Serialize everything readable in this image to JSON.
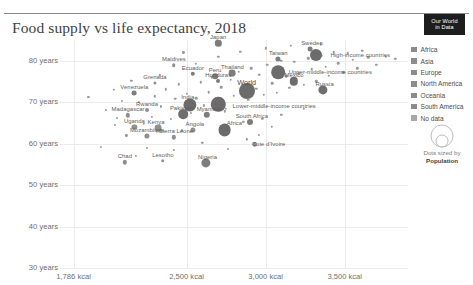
{
  "header": {
    "title": "Food supply vs life expectancy, 2018",
    "logo_line1": "Our World",
    "logo_line2": "in Data"
  },
  "legend": {
    "items": [
      {
        "label": "Africa",
        "color": "#8c8c8c"
      },
      {
        "label": "Asia",
        "color": "#8c8c8c"
      },
      {
        "label": "Europe",
        "color": "#8c8c8c"
      },
      {
        "label": "North America",
        "color": "#8c8c8c"
      },
      {
        "label": "Oceania",
        "color": "#8c8c8c"
      },
      {
        "label": "South America",
        "color": "#8c8c8c"
      },
      {
        "label": "No data",
        "color": "#a8a8a8"
      }
    ],
    "size_caption_line1": "Dots sized by",
    "size_caption_line2": "Population",
    "size_bubble_labels": [
      "1B",
      "2B"
    ]
  },
  "chart_data": {
    "type": "scatter",
    "title": "Food supply vs life expectancy, 2018",
    "xlabel": "",
    "ylabel": "Life expectancy at birth",
    "xticks": [
      "1,786 kcal",
      "2,500 kcal",
      "3,000 kcal",
      "3,500 kcal"
    ],
    "xtick_values": [
      1786,
      2500,
      3000,
      3500
    ],
    "yticks": [
      "30 years",
      "40 years",
      "50 years",
      "60 years",
      "70 years",
      "80 years"
    ],
    "ytick_values": [
      30,
      40,
      50,
      60,
      70,
      80
    ],
    "xlim": [
      1700,
      3900
    ],
    "ylim": [
      30,
      85
    ],
    "grid": true,
    "legend_position": "right",
    "points": [
      {
        "name": "Japan",
        "x": 2700,
        "y": 84.2,
        "r": 3.2,
        "color": "#7d7d7d",
        "label": true,
        "lx": 0,
        "ly": -6
      },
      {
        "name": "Taiwan",
        "x": 3080,
        "y": 80.5,
        "r": 2.6,
        "color": "#7d7d7d",
        "label": true,
        "lx": 0,
        "ly": -6
      },
      {
        "name": "Sweden",
        "x": 3280,
        "y": 82.8,
        "r": 2.4,
        "color": "#7d7d7d",
        "label": true,
        "lx": 2,
        "ly": -6
      },
      {
        "name": "Maldives",
        "x": 2420,
        "y": 78.9,
        "r": 1.8,
        "color": "#8f8f8f",
        "label": true,
        "lx": 0,
        "ly": -6
      },
      {
        "name": "Thailand",
        "x": 2790,
        "y": 77.0,
        "r": 3.4,
        "color": "#7d7d7d",
        "label": true,
        "lx": 0,
        "ly": -6
      },
      {
        "name": "Ecuador",
        "x": 2540,
        "y": 76.8,
        "r": 2.2,
        "color": "#7d7d7d",
        "label": true,
        "lx": 0,
        "ly": -6
      },
      {
        "name": "Peru",
        "x": 2680,
        "y": 76.3,
        "r": 2.8,
        "color": "#7d7d7d",
        "label": true,
        "lx": 0,
        "ly": -6
      },
      {
        "name": "Grenada",
        "x": 2300,
        "y": 74.6,
        "r": 1.6,
        "color": "#8f8f8f",
        "label": true,
        "lx": 0,
        "ly": -6
      },
      {
        "name": "Venezuela",
        "x": 2170,
        "y": 72.2,
        "r": 2.4,
        "color": "#7d7d7d",
        "label": true,
        "lx": 0,
        "ly": -6
      },
      {
        "name": "Mexico",
        "x": 3180,
        "y": 75.0,
        "r": 4.2,
        "color": "#6e6e6e",
        "label": true,
        "lx": 0,
        "ly": -6
      },
      {
        "name": "Russia",
        "x": 3360,
        "y": 72.9,
        "r": 4.6,
        "color": "#6e6e6e",
        "label": true,
        "lx": 2,
        "ly": -6
      },
      {
        "name": "World",
        "x": 2880,
        "y": 72.6,
        "r": 8.0,
        "color": "#6b6b6b",
        "label": true,
        "lx": 0,
        "ly": -9,
        "big": true
      },
      {
        "name": "India",
        "x": 2520,
        "y": 69.4,
        "r": 6.6,
        "color": "#6b6b6b",
        "label": true,
        "lx": -2,
        "ly": -8
      },
      {
        "name": "Honduras",
        "x": 2700,
        "y": 75.1,
        "r": 2.0,
        "color": "#7d7d7d",
        "label": true,
        "lx": 0,
        "ly": -6
      },
      {
        "name": "Pakistan",
        "x": 2480,
        "y": 67.1,
        "r": 4.8,
        "color": "#6e6e6e",
        "label": true,
        "lx": -2,
        "ly": -6
      },
      {
        "name": "Myanmar",
        "x": 2630,
        "y": 66.9,
        "r": 3.2,
        "color": "#7d7d7d",
        "label": true,
        "lx": 2,
        "ly": -6
      },
      {
        "name": "South Africa",
        "x": 2900,
        "y": 65.3,
        "r": 3.0,
        "color": "#7d7d7d",
        "label": true,
        "lx": 2,
        "ly": -6
      },
      {
        "name": "Rwanda",
        "x": 2250,
        "y": 68.0,
        "r": 2.0,
        "color": "#8f8f8f",
        "label": true,
        "lx": 0,
        "ly": -6
      },
      {
        "name": "Madagascar",
        "x": 2130,
        "y": 66.8,
        "r": 2.2,
        "color": "#8f8f8f",
        "label": true,
        "lx": 0,
        "ly": -6
      },
      {
        "name": "Uganda",
        "x": 2170,
        "y": 64.0,
        "r": 2.6,
        "color": "#8f8f8f",
        "label": true,
        "lx": 0,
        "ly": -6
      },
      {
        "name": "Kenya",
        "x": 2320,
        "y": 63.8,
        "r": 3.4,
        "color": "#8f8f8f",
        "label": true,
        "lx": -2,
        "ly": -6
      },
      {
        "name": "Angola",
        "x": 2540,
        "y": 63.4,
        "r": 2.6,
        "color": "#8f8f8f",
        "label": true,
        "lx": 2,
        "ly": -6
      },
      {
        "name": "Mozambique",
        "x": 2250,
        "y": 61.8,
        "r": 2.6,
        "color": "#8f8f8f",
        "label": true,
        "lx": 0,
        "ly": -6
      },
      {
        "name": "Sierra Leone",
        "x": 2420,
        "y": 61.5,
        "r": 2.2,
        "color": "#8f8f8f",
        "label": true,
        "lx": 2,
        "ly": -6
      },
      {
        "name": "Africa",
        "x": 2740,
        "y": 63.2,
        "r": 6.4,
        "color": "#6b6b6b",
        "label": true,
        "lx": 10,
        "ly": -7
      },
      {
        "name": "Cote d'Ivoire",
        "x": 2930,
        "y": 59.8,
        "r": 2.2,
        "color": "#8f8f8f",
        "label": true,
        "lx": 14,
        "ly": 0
      },
      {
        "name": "Chad",
        "x": 2110,
        "y": 55.5,
        "r": 2.2,
        "color": "#8f8f8f",
        "label": true,
        "lx": 0,
        "ly": -6
      },
      {
        "name": "Lesotho",
        "x": 2350,
        "y": 55.9,
        "r": 1.8,
        "color": "#8f8f8f",
        "label": true,
        "lx": 0,
        "ly": -6
      },
      {
        "name": "Nigeria",
        "x": 2620,
        "y": 55.3,
        "r": 4.6,
        "color": "#7d7d7d",
        "label": true,
        "lx": 2,
        "ly": -6
      }
    ],
    "aggregate_labels": [
      {
        "name": "High-income countries",
        "x": 3320,
        "y": 81.3,
        "r": 6.0,
        "color": "#6b6b6b",
        "lx": 44,
        "ly": 0
      },
      {
        "name": "Upper-middle-income countries",
        "x": 3080,
        "y": 77.2,
        "r": 6.8,
        "color": "#6b6b6b",
        "lx": 52,
        "ly": 0
      },
      {
        "name": "Lower-middle-income countries",
        "x": 2700,
        "y": 69.5,
        "r": 7.2,
        "color": "#6b6b6b",
        "lx": 56,
        "ly": 2
      }
    ],
    "background_points": [
      [
        1880,
        71.2,
        1.1
      ],
      [
        1960,
        59.3,
        1.1
      ],
      [
        2040,
        73.0,
        1.2
      ],
      [
        2090,
        70.4,
        1.0
      ],
      [
        2120,
        62.0,
        1.1
      ],
      [
        2060,
        66.2,
        1.0
      ],
      [
        2150,
        75.2,
        1.2
      ],
      [
        2200,
        70.0,
        1.1
      ],
      [
        2230,
        64.8,
        1.2
      ],
      [
        2280,
        66.4,
        1.1
      ],
      [
        2300,
        71.4,
        1.2
      ],
      [
        2340,
        69.0,
        1.1
      ],
      [
        2370,
        73.1,
        1.2
      ],
      [
        2400,
        66.0,
        1.1
      ],
      [
        2430,
        70.8,
        1.3
      ],
      [
        2450,
        74.3,
        1.2
      ],
      [
        2470,
        63.2,
        1.1
      ],
      [
        2500,
        72.0,
        1.2
      ],
      [
        2530,
        67.5,
        1.1
      ],
      [
        2560,
        71.0,
        1.3
      ],
      [
        2590,
        74.8,
        1.2
      ],
      [
        2610,
        69.2,
        1.1
      ],
      [
        2640,
        72.4,
        1.3
      ],
      [
        2660,
        76.0,
        1.2
      ],
      [
        2690,
        70.2,
        1.1
      ],
      [
        2720,
        73.6,
        1.3
      ],
      [
        2750,
        68.4,
        1.2
      ],
      [
        2780,
        75.4,
        1.3
      ],
      [
        2800,
        71.5,
        1.2
      ],
      [
        2830,
        77.4,
        1.3
      ],
      [
        2860,
        74.0,
        1.2
      ],
      [
        2890,
        70.6,
        1.3
      ],
      [
        2910,
        78.2,
        1.3
      ],
      [
        2940,
        73.2,
        1.2
      ],
      [
        2960,
        76.6,
        1.3
      ],
      [
        2990,
        71.8,
        1.2
      ],
      [
        3010,
        79.0,
        1.3
      ],
      [
        3040,
        74.6,
        1.3
      ],
      [
        3070,
        72.2,
        1.2
      ],
      [
        3100,
        80.0,
        1.3
      ],
      [
        3130,
        76.2,
        1.3
      ],
      [
        3150,
        73.4,
        1.2
      ],
      [
        3180,
        79.8,
        1.3
      ],
      [
        3210,
        77.0,
        1.3
      ],
      [
        3240,
        74.2,
        1.2
      ],
      [
        3270,
        80.6,
        1.3
      ],
      [
        3290,
        78.0,
        1.3
      ],
      [
        3320,
        75.0,
        1.2
      ],
      [
        3350,
        81.2,
        1.3
      ],
      [
        3380,
        78.6,
        1.3
      ],
      [
        3400,
        76.4,
        1.2
      ],
      [
        3430,
        82.0,
        1.3
      ],
      [
        3460,
        79.4,
        1.3
      ],
      [
        3490,
        77.2,
        1.2
      ],
      [
        3520,
        81.8,
        1.3
      ],
      [
        3550,
        80.2,
        1.3
      ],
      [
        3580,
        78.2,
        1.2
      ],
      [
        3610,
        82.4,
        1.3
      ],
      [
        3650,
        80.8,
        1.2
      ],
      [
        3700,
        79.0,
        1.2
      ],
      [
        3760,
        81.0,
        1.2
      ],
      [
        3820,
        80.4,
        1.2
      ],
      [
        2250,
        59.0,
        1.1
      ],
      [
        2420,
        58.4,
        1.1
      ],
      [
        2600,
        60.2,
        1.2
      ],
      [
        2760,
        58.8,
        1.1
      ],
      [
        2880,
        61.0,
        1.2
      ],
      [
        2960,
        62.2,
        1.1
      ],
      [
        3040,
        64.0,
        1.2
      ],
      [
        2180,
        57.0,
        1.1
      ],
      [
        2050,
        64.4,
        1.0
      ],
      [
        1990,
        68.0,
        1.0
      ],
      [
        2330,
        76.5,
        1.2
      ],
      [
        2560,
        79.2,
        1.2
      ],
      [
        2700,
        81.0,
        1.2
      ],
      [
        2840,
        82.2,
        1.2
      ],
      [
        3000,
        83.0,
        1.2
      ],
      [
        3160,
        83.6,
        1.2
      ],
      [
        3350,
        84.0,
        1.2
      ],
      [
        2480,
        82.0,
        1.1
      ],
      [
        3240,
        68.4,
        1.2
      ],
      [
        3100,
        67.0,
        1.2
      ],
      [
        2980,
        66.0,
        1.2
      ],
      [
        2860,
        65.2,
        1.2
      ],
      [
        2740,
        67.8,
        1.2
      ]
    ]
  }
}
